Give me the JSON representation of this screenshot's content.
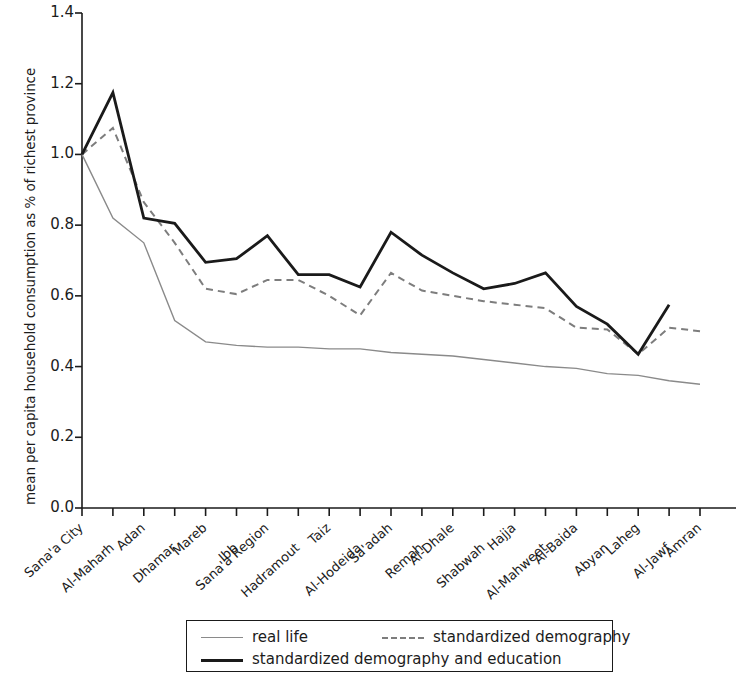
{
  "chart_data": {
    "type": "line",
    "title": "",
    "xlabel": "",
    "ylabel": "mean per capita household consumption as % of richest province",
    "ylim": [
      0.0,
      1.4
    ],
    "yticks": [
      "0.0",
      "0.2",
      "0.4",
      "0.6",
      "0.8",
      "1.0",
      "1.2",
      "1.4"
    ],
    "ytick_values": [
      0.0,
      0.2,
      0.4,
      0.6,
      0.8,
      1.0,
      1.2,
      1.4
    ],
    "grid": false,
    "legend_position": "below-axes",
    "categories": [
      "Sana'a City",
      "Al-Maharh",
      "Adan",
      "Dhamar",
      "Mareb",
      "Ibb",
      "Sana'a Region",
      "Hadramout",
      "Taiz",
      "Al-Hodeida",
      "Sa'adah",
      "Remah",
      "Al-Dhale",
      "Shabwah",
      "Hajja",
      "Al-Mahweet",
      "Al-Baida",
      "Abyan",
      "Laheg",
      "Al-Jawf",
      "Amran"
    ],
    "series": [
      {
        "name": "real life",
        "style": "solid-thin",
        "color": "#8a8a8a",
        "values": [
          1.0,
          0.82,
          0.75,
          0.53,
          0.47,
          0.46,
          0.455,
          0.455,
          0.45,
          0.45,
          0.44,
          0.435,
          0.43,
          0.42,
          0.41,
          0.4,
          0.395,
          0.38,
          0.375,
          0.36,
          0.35
        ]
      },
      {
        "name": "standardized demography",
        "style": "dashed",
        "color": "#7d7d7d",
        "values": [
          1.0,
          1.075,
          0.865,
          0.75,
          0.62,
          0.605,
          0.645,
          0.645,
          0.6,
          0.545,
          0.665,
          0.615,
          0.6,
          0.585,
          0.575,
          0.565,
          0.51,
          0.505,
          0.435,
          0.51,
          0.5
        ]
      },
      {
        "name": "standardized demography and education",
        "style": "solid-thick",
        "color": "#1a1a1a",
        "values": [
          1.0,
          1.175,
          0.82,
          0.805,
          0.695,
          0.705,
          0.77,
          0.66,
          0.66,
          0.625,
          0.78,
          0.715,
          0.665,
          0.62,
          0.635,
          0.665,
          0.57,
          0.52,
          0.435,
          0.575,
          null
        ]
      }
    ]
  },
  "legend": {
    "entries": [
      {
        "label": "real life",
        "style": "solid-thin"
      },
      {
        "label": "standardized demography",
        "style": "dashed"
      },
      {
        "label": "standardized demography and education",
        "style": "solid-thick"
      }
    ]
  }
}
